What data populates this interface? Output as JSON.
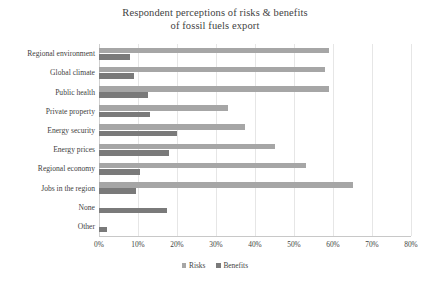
{
  "chart_data": {
    "type": "bar",
    "orientation": "horizontal",
    "title": "Respondent perceptions of risks & benefits of fossil fuels export",
    "title_lines": [
      "Respondent perceptions of risks & benefits",
      "of fossil fuels export"
    ],
    "xlabel": "",
    "ylabel": "",
    "xlim": [
      0,
      80
    ],
    "xticks": [
      0,
      10,
      20,
      30,
      40,
      50,
      60,
      70,
      80
    ],
    "xtick_labels": [
      "0%",
      "10%",
      "20%",
      "30%",
      "40%",
      "50%",
      "60%",
      "70%",
      "80%"
    ],
    "grid": true,
    "legend_position": "bottom",
    "categories": [
      "Regional environment",
      "Global climate",
      "Public health",
      "Private property",
      "Energy security",
      "Energy prices",
      "Regional economy",
      "Jobs in the region",
      "None",
      "Other"
    ],
    "series": [
      {
        "name": "Risks",
        "color": "#a6a6a6",
        "values": [
          59,
          58,
          59,
          33,
          37.5,
          45,
          53,
          65,
          0,
          0
        ]
      },
      {
        "name": "Benefits",
        "color": "#7a7a7a",
        "values": [
          8,
          9,
          12.5,
          13,
          20,
          18,
          10.5,
          9.5,
          17.5,
          2
        ]
      }
    ]
  },
  "legend": {
    "entries": [
      {
        "label": "Risks"
      },
      {
        "label": "Benefits"
      }
    ]
  },
  "colors": {
    "risks": "#a6a6a6",
    "benefits": "#7a7a7a",
    "grid": "#e6e6e6",
    "axis": "#c8c8c8",
    "text": "#3f3f3f"
  }
}
